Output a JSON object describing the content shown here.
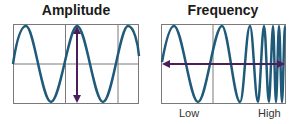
{
  "panels": [
    {
      "title": "Amplitude",
      "labels": []
    },
    {
      "title": "Frequency",
      "labels": {
        "low": "Low",
        "high": "High"
      }
    }
  ],
  "colors": {
    "wave": "#1f5a7a",
    "arrow": "#4a1f5c",
    "grid": "#7a7a7a"
  }
}
